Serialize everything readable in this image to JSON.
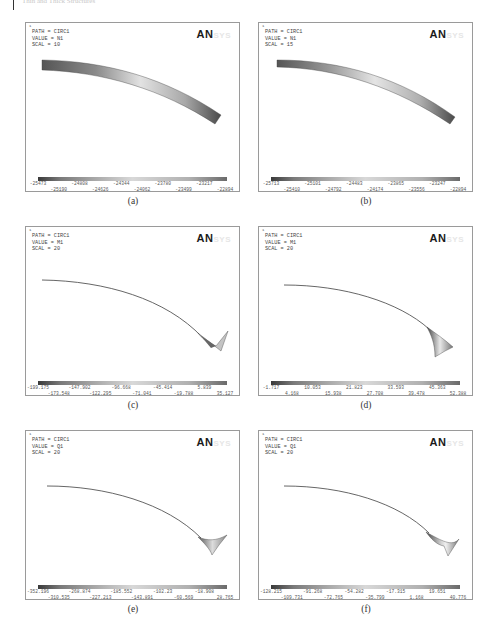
{
  "page_header": {
    "text": "Thin and Thick Structures"
  },
  "panels": [
    {
      "id": "a",
      "caption": "(a)",
      "corner": "1",
      "path": "PATH = CIRC1",
      "value": "VALUE = N1",
      "scal": "SCAL = 10",
      "logo_main": "AN",
      "logo_fade": "SYS",
      "legend_top": [
        "-25473",
        "-24808",
        "-24344",
        "-23780",
        "-23217"
      ],
      "legend_bottom": [
        "-25190",
        "-24626",
        "-24062",
        "-23499",
        "-22894"
      ]
    },
    {
      "id": "b",
      "caption": "(b)",
      "corner": "1",
      "path": "PATH = CIRC1",
      "value": "VALUE = N1",
      "scal": "SCAL = 15",
      "logo_main": "AN",
      "logo_fade": "SYS",
      "legend_top": [
        "-25713",
        "-25101",
        "-24483",
        "-23865",
        "-23247"
      ],
      "legend_bottom": [
        "-25410",
        "-24792",
        "-24174",
        "-23556",
        "-22894"
      ]
    },
    {
      "id": "c",
      "caption": "(c)",
      "corner": "1",
      "path": "PATH = CIRC1",
      "value": "VALUE = M1",
      "scal": "SCAL = 20",
      "logo_main": "AN",
      "logo_fade": "SYS",
      "legend_top": [
        "-199.175",
        "-147.902",
        "-96.668",
        "-45.414",
        "5.839"
      ],
      "legend_bottom": [
        "-173.548",
        "-122.295",
        "-71.041",
        "-19.788",
        "35.127"
      ]
    },
    {
      "id": "d",
      "caption": "(d)",
      "corner": "1",
      "path": "PATH = CIRC1",
      "value": "VALUE = M1",
      "scal": "SCAL = 20",
      "logo_main": "AN",
      "logo_fade": "SYS",
      "legend_top": [
        "-1.717",
        "10.053",
        "21.823",
        "33.593",
        "45.363"
      ],
      "legend_bottom": [
        "4.168",
        "15.938",
        "27.708",
        "39.478",
        "52.388"
      ]
    },
    {
      "id": "e",
      "caption": "(e)",
      "corner": "1",
      "path": "PATH = CIRC1",
      "value": "VALUE = Q1",
      "scal": "SCAL = 20",
      "logo_main": "AN",
      "logo_fade": "SYS",
      "legend_top": [
        "-352.196",
        "-268.874",
        "-185.552",
        "-102.23",
        "-18.908"
      ],
      "legend_bottom": [
        "-310.535",
        "-227.213",
        "-143.891",
        "-60.569",
        "28.765"
      ]
    },
    {
      "id": "f",
      "caption": "(f)",
      "corner": "1",
      "path": "PATH = CIRC1",
      "value": "VALUE = Q1",
      "scal": "SCAL = 20",
      "logo_main": "AN",
      "logo_fade": "SYS",
      "legend_top": [
        "-128.215",
        "-91.268",
        "-54.282",
        "-17.315",
        "19.651"
      ],
      "legend_bottom": [
        "-109.731",
        "-72.765",
        "-35.799",
        "1.168",
        "40.776"
      ]
    }
  ],
  "colors": {
    "frame": "#9a9a9a",
    "text": "#444444",
    "band_dark": "#3a3a3a",
    "band_light": "#e0e0e0"
  }
}
